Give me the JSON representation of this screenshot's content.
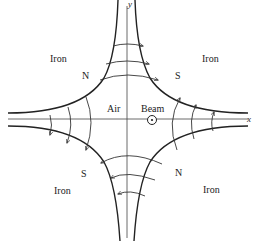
{
  "axes": {
    "x_label": "x",
    "y_label": "y"
  },
  "regions": {
    "iron_top_left": "Iron",
    "iron_top_right": "Iron",
    "iron_bottom_left": "Iron",
    "iron_bottom_right": "Iron",
    "air": "Air",
    "beam": "Beam"
  },
  "poles": {
    "top_left": "N",
    "top_right": "S",
    "bottom_left": "S",
    "bottom_right": "N"
  },
  "beam_symbol": "out-of-page-dot",
  "field_lines": {
    "top": {
      "count": 3,
      "direction": "right"
    },
    "bottom": {
      "count": 3,
      "direction": "left"
    },
    "left": {
      "count": 3,
      "direction": "down"
    },
    "right": {
      "count": 3,
      "direction": "up"
    }
  }
}
